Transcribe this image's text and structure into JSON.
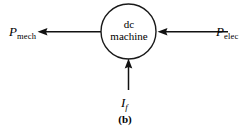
{
  "figure": {
    "caption": "(b)",
    "block": {
      "name": "dc-machine-block",
      "line1": "dc",
      "line2": "machine",
      "shape": "circle",
      "stroke_color": "#1a1a1a"
    },
    "labels": {
      "left": {
        "symbol": "P",
        "subscript": "mech",
        "full": "P_mech"
      },
      "right": {
        "symbol": "P",
        "subscript": "elec",
        "full": "P_elec"
      },
      "bottom": {
        "symbol": "I",
        "subscript": "f",
        "full": "I_f"
      }
    },
    "arrows": [
      {
        "name": "mechanical-power-output-arrow",
        "direction": "left",
        "from": "dc-machine-block",
        "to": "P_mech",
        "color": "#111111"
      },
      {
        "name": "electrical-power-input-arrow",
        "direction": "left",
        "from": "P_elec",
        "to": "dc-machine-block",
        "color": "#111111"
      },
      {
        "name": "field-current-input-arrow",
        "direction": "up",
        "from": "I_f",
        "to": "dc-machine-block",
        "color": "#111111"
      }
    ],
    "colors": {
      "background": "#ffffff",
      "ink": "#111111"
    }
  }
}
